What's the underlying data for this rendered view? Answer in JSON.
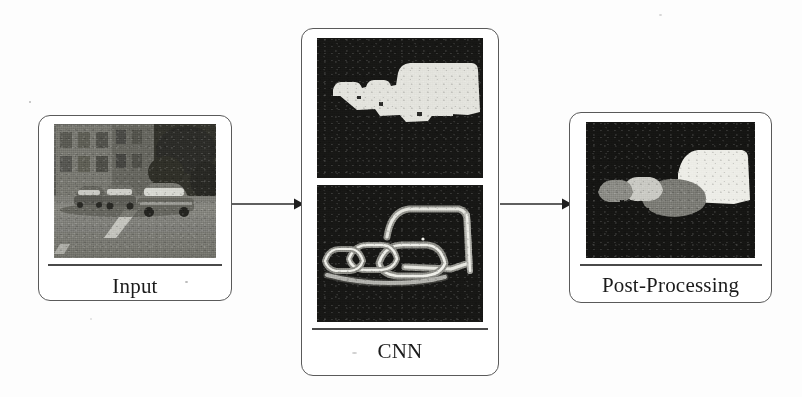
{
  "figure": {
    "type": "pipeline-diagram",
    "title": "",
    "background_color": "#fdfdfd",
    "box_border_color": "#5a5a5a",
    "label_color": "#1b1b1b"
  },
  "stages": [
    {
      "id": "input",
      "label": "Input",
      "panel_count": 1,
      "panels": [
        {
          "name": "street-photo",
          "kind": "photograph",
          "description": "Grayscale street scene: a row of parked cars along a road with a building and foliage behind",
          "background_color": "#141414"
        }
      ]
    },
    {
      "id": "cnn",
      "label": "CNN",
      "panel_count": 2,
      "panels": [
        {
          "name": "semantic-mask",
          "kind": "binary-segmentation-mask",
          "description": "White vehicle-class blob over black background",
          "background_color": "#161616",
          "mask_color": "#e3e3df"
        },
        {
          "name": "boundary-map",
          "kind": "instance-boundary-map",
          "description": "Gray and white contour outlines tracing each vehicle over black background",
          "background_color": "#161616",
          "contour_colors": [
            "#f2f2ee",
            "#9a9a96",
            "#6e6e6a"
          ]
        }
      ]
    },
    {
      "id": "post-processing",
      "label": "Post-Processing",
      "panel_count": 1,
      "panels": [
        {
          "name": "instance-segmentation",
          "kind": "instance-segmentation-mask",
          "description": "Four separated vehicle instances in distinct gray levels over black background",
          "background_color": "#141414",
          "instances": [
            {
              "name": "car-1",
              "color": "#8b8b86"
            },
            {
              "name": "car-2",
              "color": "#c9c9c3"
            },
            {
              "name": "car-3",
              "color": "#7a7a75"
            },
            {
              "name": "truck",
              "color": "#ececE6"
            }
          ]
        }
      ]
    }
  ],
  "arrows": [
    {
      "name": "arrow-input-to-cnn",
      "from": "input",
      "to": "cnn",
      "direction": "right"
    },
    {
      "name": "arrow-cnn-to-post",
      "from": "cnn",
      "to": "post-processing",
      "direction": "right"
    }
  ]
}
